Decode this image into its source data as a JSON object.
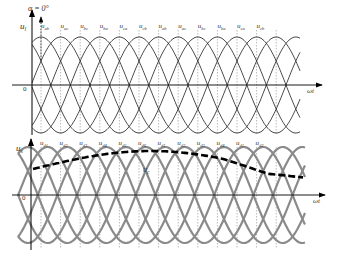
{
  "figure": {
    "top_panel": {
      "y_axis_label": "u",
      "y_axis_sub": "l",
      "x_axis_label": "ωt",
      "origin_label": "0",
      "alpha_label": "α = 0°",
      "wave_labels": [
        {
          "main": "u",
          "sub": "ab"
        },
        {
          "main": "u",
          "sub": "ac"
        },
        {
          "main": "u",
          "sub": "bc"
        },
        {
          "main": "u",
          "sub": "ba"
        },
        {
          "main": "u",
          "sub": "ca"
        },
        {
          "main": "u",
          "sub": "cb"
        },
        {
          "main": "u",
          "sub": "ab"
        },
        {
          "main": "u",
          "sub": "ac"
        },
        {
          "main": "u",
          "sub": "bc"
        },
        {
          "main": "u",
          "sub": "ba"
        },
        {
          "main": "u",
          "sub": "ca"
        },
        {
          "main": "u",
          "sub": "cb"
        }
      ],
      "line_color": "#333333"
    },
    "bottom_panel": {
      "y_axis_label": "u",
      "y_axis_sub": "s",
      "x_axis_label": "ωt",
      "origin_label": "0",
      "control_label": "u",
      "control_sub": "c",
      "wave_labels": [
        {
          "main": "u",
          "sub": "d1"
        },
        {
          "main": "u",
          "sub": "d2"
        },
        {
          "main": "u",
          "sub": "d3"
        },
        {
          "main": "u",
          "sub": "d4"
        },
        {
          "main": "u",
          "sub": "d5"
        },
        {
          "main": "u",
          "sub": "d6"
        },
        {
          "main": "u",
          "sub": "d1"
        },
        {
          "main": "u",
          "sub": "d2"
        },
        {
          "main": "u",
          "sub": "d3"
        },
        {
          "main": "u",
          "sub": "d4"
        },
        {
          "main": "u",
          "sub": "d1"
        },
        {
          "main": "u",
          "sub": "d2"
        }
      ],
      "line_color": "#8a8a8a",
      "control_color": "#000000"
    }
  }
}
